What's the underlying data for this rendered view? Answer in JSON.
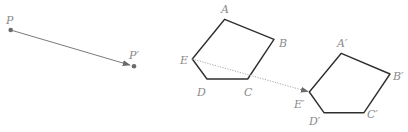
{
  "figure": {
    "colors": {
      "shape_stroke": "#2f2f2f",
      "vector": "#7a7a7a",
      "dotted_vector": "#b0b0b0",
      "label": "#8a8a8a",
      "point": "#6a6a6a"
    },
    "point_translation": {
      "P": {
        "label": "P",
        "x": 10.7,
        "y": 30,
        "label_x": 6,
        "label_y": 24
      },
      "P_prime": {
        "label": "P′",
        "x": 134,
        "y": 66.3,
        "label_x": 129,
        "label_y": 59
      }
    },
    "pentagon": {
      "vertices": [
        {
          "name": "A",
          "label": "A",
          "x": 224.7,
          "y": 19.3,
          "label_x": 221,
          "label_y": 13
        },
        {
          "name": "B",
          "label": "B",
          "x": 274,
          "y": 39.3,
          "label_x": 279,
          "label_y": 47
        },
        {
          "name": "C",
          "label": "C",
          "x": 247.7,
          "y": 79,
          "label_x": 244,
          "label_y": 96
        },
        {
          "name": "D",
          "label": "D",
          "x": 207,
          "y": 79,
          "label_x": 197,
          "label_y": 96
        },
        {
          "name": "E",
          "label": "E",
          "x": 192.3,
          "y": 59,
          "label_x": 180,
          "label_y": 64
        }
      ]
    },
    "pentagon_image": {
      "vertices": [
        {
          "name": "A'",
          "label": "A′",
          "x": 341.3,
          "y": 53.3,
          "label_x": 337,
          "label_y": 47
        },
        {
          "name": "B'",
          "label": "B′",
          "x": 390,
          "y": 74,
          "label_x": 393,
          "label_y": 80
        },
        {
          "name": "C'",
          "label": "C′",
          "x": 364,
          "y": 112.7,
          "label_x": 367,
          "label_y": 118
        },
        {
          "name": "D'",
          "label": "D′",
          "x": 324,
          "y": 112.7,
          "label_x": 309,
          "label_y": 125
        },
        {
          "name": "E'",
          "label": "E′",
          "x": 309.3,
          "y": 92,
          "label_x": 294,
          "label_y": 108
        }
      ]
    },
    "dotted_vector": {
      "from": "E",
      "to": "E'"
    }
  }
}
